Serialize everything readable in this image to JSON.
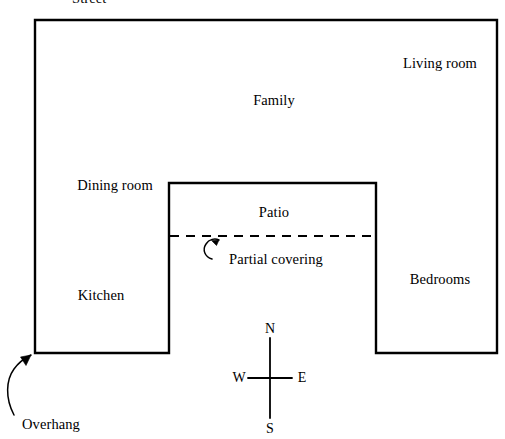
{
  "diagram": {
    "type": "floor-plan",
    "stroke_color": "#000000",
    "background_color": "#ffffff",
    "outline_stroke_width": 2.4,
    "dashed_stroke_width": 2.0
  },
  "house": {
    "outline_shape": "u-shaped",
    "outer": {
      "x": 35,
      "y": 20,
      "width": 462,
      "height": 333
    },
    "patio_notch": {
      "x": 169,
      "y": 183,
      "width": 207,
      "height": 170
    }
  },
  "rooms": [
    {
      "key": "living_room",
      "label": "Living room",
      "x": 440,
      "y": 64
    },
    {
      "key": "family",
      "label": "Family",
      "x": 274,
      "y": 101
    },
    {
      "key": "dining_room",
      "label": "Dining room",
      "x": 115,
      "y": 186
    },
    {
      "key": "patio",
      "label": "Patio",
      "x": 274,
      "y": 213
    },
    {
      "key": "kitchen",
      "label": "Kitchen",
      "x": 101,
      "y": 296
    },
    {
      "key": "bedrooms",
      "label": "Bedrooms",
      "x": 440,
      "y": 280
    }
  ],
  "annotations": {
    "street": {
      "label": "Street",
      "x": 72,
      "y": -9
    },
    "partial_covering": {
      "label": "Partial covering",
      "x": 276,
      "y": 261
    },
    "overhang": {
      "label": "Overhang",
      "x": 22,
      "y": 425
    }
  },
  "partial_covering_line": {
    "x1": 170,
    "x2": 375,
    "y": 236,
    "dash": "9 7"
  },
  "compass": {
    "center_x": 270,
    "center_y": 378,
    "vertical_top": 338,
    "vertical_bottom": 418,
    "horizontal_left": 248,
    "horizontal_right": 292,
    "north": "N",
    "south": "S",
    "east": "E",
    "west": "W",
    "north_label_x": 270,
    "north_label_y": 329,
    "south_label_x": 270,
    "south_label_y": 429,
    "west_label_x": 239,
    "west_label_y": 378,
    "east_label_x": 302,
    "east_label_y": 378
  }
}
